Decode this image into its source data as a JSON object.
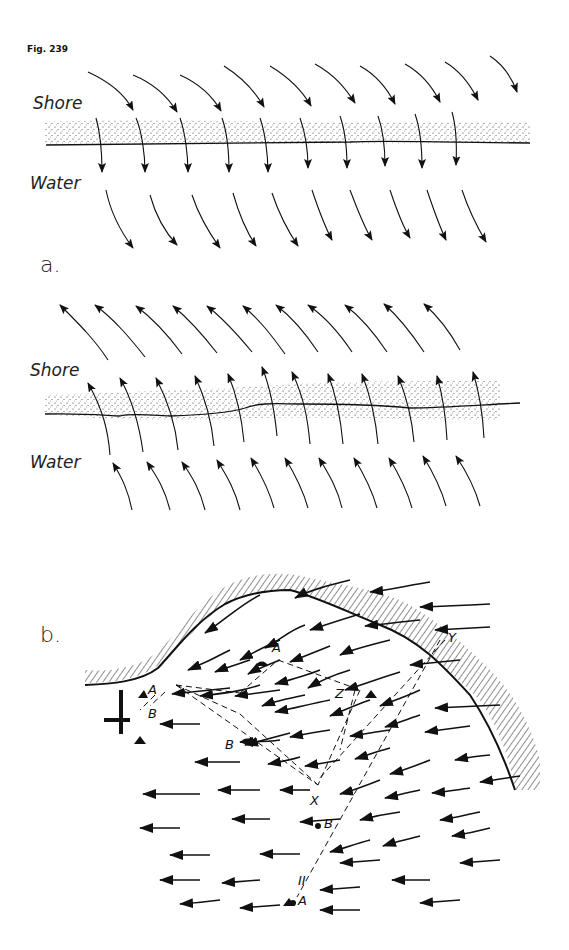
{
  "figure": {
    "title": "Fig. 239"
  },
  "panel_a": {
    "label": "a.",
    "top_diagram": {
      "shore_label": "Shore",
      "water_label": "Water",
      "arrow_direction": "from shore toward water (downward, curving right-to-left slant)"
    },
    "bottom_diagram": {
      "shore_label": "Shore",
      "water_label": "Water",
      "arrow_direction": "from water toward shore (upward, curving)"
    }
  },
  "panel_b": {
    "label": "b.",
    "points": {
      "A_upper": "A",
      "A_left": "A",
      "B_left": "B",
      "B_mid": "B",
      "Z": "Z",
      "Y": "Y",
      "X": "X",
      "B_lower": "B",
      "A_lower": "A",
      "roman_two": "II"
    }
  }
}
